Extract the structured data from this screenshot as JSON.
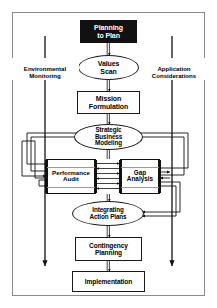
{
  "diagram": {
    "type": "flowchart",
    "frame_border_color": "#8a8a8a",
    "background_color": "#ffffff",
    "line_color": "#111111",
    "nodes": [
      {
        "id": "planning-to-plan",
        "label": "Planning\nto Plan",
        "shape": "box-filled",
        "fill": "#111111",
        "text_color": "#ffffff"
      },
      {
        "id": "values-scan",
        "label": "Values\nScan",
        "shape": "ellipse",
        "fill": "#ffffff",
        "text_color": "#000000"
      },
      {
        "id": "mission-formulation",
        "label": "Mission\nFormulation",
        "shape": "box",
        "fill": "#ffffff",
        "text_color": "#000000"
      },
      {
        "id": "strategic-business-modeling",
        "label": "Strategic\nBusiness\nModeling",
        "shape": "ellipse",
        "fill": "#ffffff",
        "text_color": "#000000"
      },
      {
        "id": "performance-audit",
        "label": "Performance\nAudit",
        "shape": "striped-box",
        "fill": "#ffffff",
        "text_color": "#000000"
      },
      {
        "id": "gap-analysis",
        "label": "Gap\nAnalysis",
        "shape": "striped-box",
        "fill": "#ffffff",
        "text_color": "#000000"
      },
      {
        "id": "integrating-action-plans",
        "label": "Integrating\nAction Plans",
        "shape": "ellipse",
        "fill": "#ffffff",
        "text_color": "#000000"
      },
      {
        "id": "contingency-planning",
        "label": "Contingency\nPlanning",
        "shape": "box",
        "fill": "#ffffff",
        "text_color": "#000000"
      },
      {
        "id": "implementation",
        "label": "Implementation",
        "shape": "box",
        "fill": "#ffffff",
        "text_color": "#000000"
      }
    ],
    "side_labels": [
      {
        "id": "environmental-monitoring",
        "label": "Environmental\nMonitoring",
        "side": "left"
      },
      {
        "id": "application-considerations",
        "label": "Application\nConsiderations",
        "side": "right"
      }
    ]
  }
}
